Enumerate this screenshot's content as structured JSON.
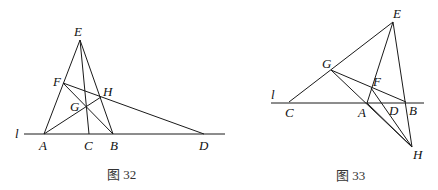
{
  "figures": [
    {
      "caption": "图 32",
      "line_label": "l",
      "points": {
        "E": [
          80,
          40
        ],
        "A": [
          44,
          134
        ],
        "C": [
          89,
          134
        ],
        "B": [
          113,
          134
        ],
        "D": [
          204,
          134
        ],
        "F": [
          63,
          83
        ],
        "H": [
          101,
          97
        ],
        "G": [
          86,
          106
        ]
      },
      "labels": {
        "E": "E",
        "F": "F",
        "G": "G",
        "H": "H",
        "A": "A",
        "B": "B",
        "C": "C",
        "D": "D"
      }
    },
    {
      "caption": "图 33",
      "line_label": "l",
      "points": {
        "E": [
          393,
          22
        ],
        "C": [
          289,
          102
        ],
        "G": [
          331,
          70
        ],
        "F": [
          371,
          88
        ],
        "A": [
          367,
          103
        ],
        "D": [
          393,
          103
        ],
        "B": [
          406,
          102
        ],
        "H": [
          412,
          147
        ]
      },
      "labels": {
        "E": "E",
        "G": "G",
        "F": "F",
        "C": "C",
        "A": "A",
        "D": "D",
        "B": "B",
        "H": "H"
      }
    }
  ]
}
